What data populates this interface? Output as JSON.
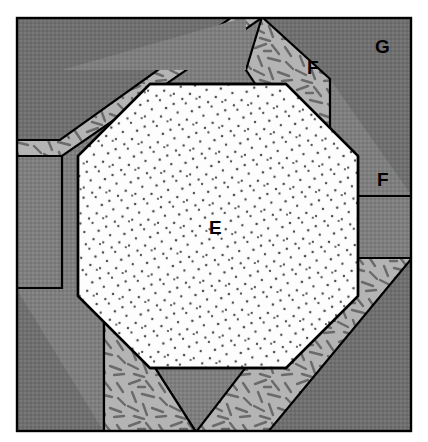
{
  "figure": {
    "canvas": {
      "width": 428,
      "height": 442
    },
    "frame": {
      "x": 16,
      "y": 17,
      "width": 396,
      "height": 415
    },
    "colors": {
      "background": "#ffffff",
      "outer_dark_gray": "#7c7c7c",
      "outer_darker_gray": "#6e6e6e",
      "band_light_gray": "#b4b4b4",
      "core_white": "#fdfdfd",
      "stroke_black": "#000000",
      "stipple_dot": "#4a4a4a",
      "dash_mark": "#6a6a6a"
    },
    "regions": [
      {
        "id": "E",
        "label": "E",
        "name": "core-octagon-stippled",
        "fill": "#fdfdfd",
        "pattern": "stipple-dots",
        "label_x": 209,
        "label_y": 218
      },
      {
        "id": "F",
        "label": "F",
        "name": "band-upper-right-dashed",
        "fill": "#b4b4b4",
        "pattern": "dash-gravel",
        "label_x": 307,
        "label_y": 58
      },
      {
        "id": "F",
        "label": "F",
        "name": "outer-right-solid",
        "fill": "#7c7c7c",
        "pattern": "solid-gray",
        "label_x": 377,
        "label_y": 170
      },
      {
        "id": "G",
        "label": "G",
        "name": "outer-corner-dark",
        "fill": "#6e6e6e",
        "pattern": "solid-dark-gray",
        "label_x": 375,
        "label_y": 37
      }
    ],
    "labels": [
      {
        "key": "e",
        "text": "E"
      },
      {
        "key": "f1",
        "text": "F"
      },
      {
        "key": "f2",
        "text": "F"
      },
      {
        "key": "g",
        "text": "G"
      }
    ],
    "geometry": {
      "octagon_bbox": {
        "left": 78,
        "top": 84,
        "right": 358,
        "bottom": 368
      },
      "octagon_chamfer": 72,
      "band_offset": 34
    }
  }
}
